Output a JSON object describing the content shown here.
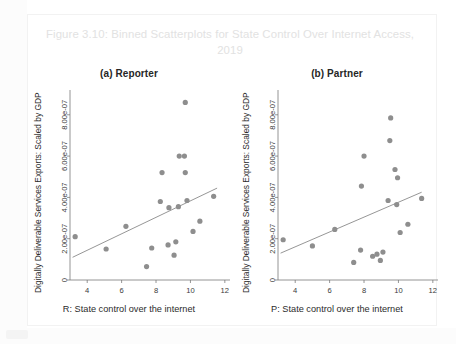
{
  "figure": {
    "title": "Figure 3.10: Binned Scatterplots for State Control Over Internet Access, 2019"
  },
  "panels": [
    {
      "key": "reporter",
      "label": "(a) Reporter",
      "xlabel": "R: State control over the internet",
      "ylabel": "Digitally Deliverable Services Exports: Scaled by GDP"
    },
    {
      "key": "partner",
      "label": "(b) Partner",
      "xlabel": "P: State control over the internet",
      "ylabel": "Digitally Deliverable Services Exports: Scaled by GDP"
    }
  ],
  "colors": {
    "dot": "#8e8e8e",
    "fit_line": "#8a8a8a",
    "axis": "#7a7a7a",
    "title": "#e2e2e2",
    "text": "#2b2b2b",
    "background": "#ffffff"
  },
  "chart_data": [
    {
      "type": "scatter",
      "title": "(a) Reporter",
      "xlabel": "R: State control over the internet",
      "ylabel": "Digitally Deliverable Services Exports: Scaled by GDP",
      "xlim": [
        3.0,
        12.3
      ],
      "ylim": [
        0,
        9.2e-07
      ],
      "xticks": [
        4,
        6,
        8,
        10,
        12
      ],
      "xticklabels": [
        "4",
        "6",
        "8",
        "10",
        "12"
      ],
      "yticks": [
        0,
        2e-07,
        4e-07,
        6e-07,
        8e-07
      ],
      "yticklabels": [
        "0",
        "2.00e-07",
        "4.00e-07",
        "6.00e-07",
        "8.00e-07"
      ],
      "grid": false,
      "legend": "none",
      "points": [
        {
          "x": 3.3,
          "y": 2.1e-07
        },
        {
          "x": 5.1,
          "y": 1.5e-07
        },
        {
          "x": 6.25,
          "y": 2.6e-07
        },
        {
          "x": 7.45,
          "y": 6.5e-08
        },
        {
          "x": 7.75,
          "y": 1.55e-07
        },
        {
          "x": 8.25,
          "y": 3.8e-07
        },
        {
          "x": 8.35,
          "y": 5.2e-07
        },
        {
          "x": 8.7,
          "y": 1.7e-07
        },
        {
          "x": 8.75,
          "y": 3.5e-07
        },
        {
          "x": 9.05,
          "y": 1.2e-07
        },
        {
          "x": 9.15,
          "y": 1.85e-07
        },
        {
          "x": 9.3,
          "y": 3.55e-07
        },
        {
          "x": 9.35,
          "y": 6e-07
        },
        {
          "x": 9.65,
          "y": 6e-07
        },
        {
          "x": 9.7,
          "y": 8.6e-07
        },
        {
          "x": 9.7,
          "y": 5.2e-07
        },
        {
          "x": 9.8,
          "y": 3.85e-07
        },
        {
          "x": 10.15,
          "y": 2.35e-07
        },
        {
          "x": 10.55,
          "y": 2.85e-07
        },
        {
          "x": 11.35,
          "y": 4.05e-07
        }
      ],
      "fit_line": {
        "x0": 3.15,
        "y0": 1.1e-07,
        "x1": 11.55,
        "y1": 4.45e-07
      }
    },
    {
      "type": "scatter",
      "title": "(b) Partner",
      "xlabel": "P: State control over the internet",
      "ylabel": "Digitally Deliverable Services Exports: Scaled by GDP",
      "xlim": [
        3.0,
        12.3
      ],
      "ylim": [
        0,
        9.2e-07
      ],
      "xticks": [
        4,
        6,
        8,
        10,
        12
      ],
      "xticklabels": [
        "4",
        "6",
        "8",
        "10",
        "12"
      ],
      "yticks": [
        0,
        2e-07,
        4e-07,
        6e-07,
        8e-07
      ],
      "yticklabels": [
        "0",
        "2.00e-07",
        "4.00e-07",
        "6.00e-07",
        "8.00e-07"
      ],
      "grid": false,
      "legend": "none",
      "points": [
        {
          "x": 3.3,
          "y": 1.95e-07
        },
        {
          "x": 5.0,
          "y": 1.65e-07
        },
        {
          "x": 6.3,
          "y": 2.45e-07
        },
        {
          "x": 7.4,
          "y": 8.5e-08
        },
        {
          "x": 7.8,
          "y": 1.45e-07
        },
        {
          "x": 7.85,
          "y": 4.55e-07
        },
        {
          "x": 8.0,
          "y": 6e-07
        },
        {
          "x": 8.5,
          "y": 1.15e-07
        },
        {
          "x": 8.75,
          "y": 1.25e-07
        },
        {
          "x": 8.95,
          "y": 9.5e-08
        },
        {
          "x": 9.1,
          "y": 1.35e-07
        },
        {
          "x": 9.4,
          "y": 3.85e-07
        },
        {
          "x": 9.5,
          "y": 6.75e-07
        },
        {
          "x": 9.55,
          "y": 7.85e-07
        },
        {
          "x": 9.8,
          "y": 5.35e-07
        },
        {
          "x": 9.9,
          "y": 3.65e-07
        },
        {
          "x": 9.95,
          "y": 4.95e-07
        },
        {
          "x": 10.1,
          "y": 2.3e-07
        },
        {
          "x": 10.55,
          "y": 2.7e-07
        },
        {
          "x": 11.35,
          "y": 3.95e-07
        }
      ],
      "fit_line": {
        "x0": 3.15,
        "y0": 1.3e-07,
        "x1": 11.35,
        "y1": 4.25e-07
      }
    }
  ]
}
